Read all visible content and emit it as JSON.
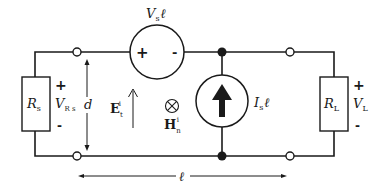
{
  "diagram": {
    "type": "equivalent-circuit",
    "components": {
      "source_resistor": {
        "symbol": "R",
        "subscript": "s"
      },
      "source_voltage_label": {
        "symbol": "V",
        "subscript": "R s"
      },
      "series_voltage_source": {
        "symbol": "V",
        "subscript": "s",
        "suffix": "ℓ",
        "plus": "+",
        "minus": "-"
      },
      "shunt_current_source": {
        "symbol": "I",
        "subscript": "s",
        "suffix": "ℓ"
      },
      "load_resistor": {
        "symbol": "R",
        "subscript": "L"
      },
      "load_voltage_label": {
        "symbol": "V",
        "subscript": "L"
      }
    },
    "polarity": {
      "rs_plus": "+",
      "rs_minus": "-",
      "rl_plus": "+",
      "rl_minus": "-"
    },
    "fields": {
      "electric": {
        "symbol": "E",
        "subscript": "t",
        "superscript": "i"
      },
      "magnetic": {
        "symbol": "H",
        "subscript": "n",
        "superscript": "i",
        "direction_glyph": "⊗"
      }
    },
    "dimensions": {
      "separation": "d",
      "length": "ℓ"
    }
  }
}
